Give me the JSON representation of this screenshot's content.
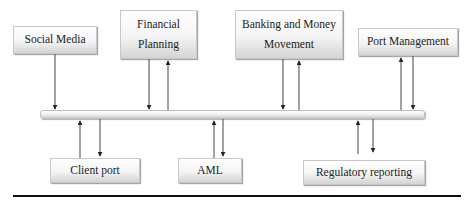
{
  "diagram": {
    "bus_label": "",
    "top_modules": [
      {
        "id": "social-media",
        "lines": [
          "Social Media"
        ]
      },
      {
        "id": "financial-planning",
        "lines": [
          "Financial",
          "Planning"
        ]
      },
      {
        "id": "banking-money-movement",
        "lines": [
          "Banking and Money",
          "Movement"
        ]
      },
      {
        "id": "port-management",
        "lines": [
          "Port Management"
        ]
      }
    ],
    "bottom_modules": [
      {
        "id": "client-port",
        "lines": [
          "Client port"
        ]
      },
      {
        "id": "aml",
        "lines": [
          "AML"
        ]
      },
      {
        "id": "regulatory-reporting",
        "lines": [
          "Regulatory reporting"
        ]
      }
    ],
    "connections": [
      {
        "from": "Social Media",
        "to": "bus",
        "direction": "one-way to bus"
      },
      {
        "from": "Financial Planning",
        "to": "bus",
        "direction": "bidirectional"
      },
      {
        "from": "Banking and Money Movement",
        "to": "bus",
        "direction": "bidirectional"
      },
      {
        "from": "Port Management",
        "to": "bus",
        "direction": "bidirectional"
      },
      {
        "from": "Client port",
        "to": "bus",
        "direction": "bidirectional"
      },
      {
        "from": "AML",
        "to": "bus",
        "direction": "bidirectional"
      },
      {
        "from": "Regulatory reporting",
        "to": "bus",
        "direction": "bidirectional"
      }
    ]
  }
}
